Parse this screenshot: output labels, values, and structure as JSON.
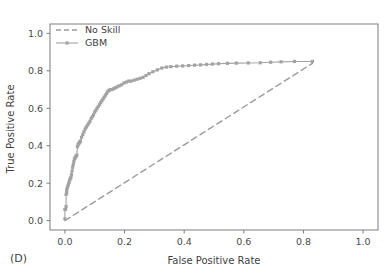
{
  "panel": {
    "label": "(D)"
  },
  "chart_data": {
    "type": "line",
    "title": "",
    "xlabel": "False Positive Rate",
    "ylabel": "True Positive Rate",
    "xlim": [
      -0.05,
      1.05
    ],
    "ylim": [
      -0.05,
      1.05
    ],
    "grid": false,
    "legend_position": "upper-left",
    "xticks": [
      "0.0",
      "0.2",
      "0.4",
      "0.6",
      "0.8",
      "1.0"
    ],
    "xtick_values": [
      0.0,
      0.2,
      0.4,
      0.6,
      0.8,
      1.0
    ],
    "yticks": [
      "0.0",
      "0.2",
      "0.4",
      "0.6",
      "0.8",
      "1.0"
    ],
    "ytick_values": [
      0.0,
      0.2,
      0.4,
      0.6,
      0.8,
      1.0
    ],
    "series": [
      {
        "name": "No Skill",
        "style": "dashed",
        "marker": "none",
        "color": "#9b9b9b",
        "x": [
          0.0,
          0.83
        ],
        "y": [
          0.0,
          0.84
        ]
      },
      {
        "name": "GBM",
        "style": "solid",
        "marker": "square",
        "color": "#a3a3a3",
        "x": [
          0.0,
          0.0,
          0.002,
          0.004,
          0.004,
          0.006,
          0.006,
          0.008,
          0.01,
          0.012,
          0.014,
          0.016,
          0.018,
          0.02,
          0.022,
          0.024,
          0.026,
          0.028,
          0.03,
          0.032,
          0.034,
          0.036,
          0.038,
          0.04,
          0.042,
          0.044,
          0.046,
          0.048,
          0.05,
          0.052,
          0.056,
          0.06,
          0.064,
          0.068,
          0.072,
          0.076,
          0.08,
          0.084,
          0.088,
          0.092,
          0.096,
          0.1,
          0.104,
          0.108,
          0.112,
          0.116,
          0.12,
          0.124,
          0.128,
          0.132,
          0.136,
          0.14,
          0.144,
          0.148,
          0.152,
          0.158,
          0.164,
          0.17,
          0.176,
          0.182,
          0.19,
          0.198,
          0.206,
          0.214,
          0.222,
          0.232,
          0.242,
          0.252,
          0.262,
          0.272,
          0.282,
          0.295,
          0.31,
          0.325,
          0.34,
          0.355,
          0.375,
          0.395,
          0.415,
          0.435,
          0.455,
          0.475,
          0.495,
          0.515,
          0.545,
          0.575,
          0.615,
          0.655,
          0.69,
          0.725,
          0.77,
          0.83
        ],
        "y": [
          0.01,
          0.06,
          0.06,
          0.075,
          0.14,
          0.15,
          0.165,
          0.175,
          0.185,
          0.195,
          0.205,
          0.215,
          0.225,
          0.23,
          0.245,
          0.265,
          0.285,
          0.3,
          0.315,
          0.33,
          0.335,
          0.34,
          0.345,
          0.35,
          0.395,
          0.405,
          0.41,
          0.415,
          0.42,
          0.425,
          0.445,
          0.46,
          0.475,
          0.49,
          0.5,
          0.51,
          0.52,
          0.53,
          0.545,
          0.555,
          0.565,
          0.58,
          0.59,
          0.6,
          0.61,
          0.62,
          0.63,
          0.64,
          0.65,
          0.66,
          0.67,
          0.68,
          0.69,
          0.695,
          0.7,
          0.7,
          0.705,
          0.71,
          0.715,
          0.72,
          0.725,
          0.735,
          0.74,
          0.745,
          0.745,
          0.75,
          0.755,
          0.76,
          0.765,
          0.775,
          0.785,
          0.795,
          0.805,
          0.815,
          0.82,
          0.822,
          0.825,
          0.826,
          0.828,
          0.83,
          0.832,
          0.834,
          0.836,
          0.838,
          0.84,
          0.841,
          0.842,
          0.843,
          0.846,
          0.848,
          0.85,
          0.85
        ]
      }
    ],
    "legend_entries": [
      "No Skill",
      "GBM"
    ]
  }
}
